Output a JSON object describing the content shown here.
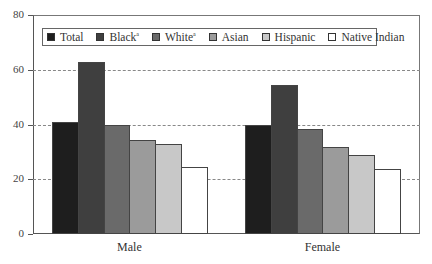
{
  "chart_data": {
    "type": "bar",
    "title": "",
    "xlabel": "",
    "ylabel": "",
    "ylim": [
      0,
      80
    ],
    "yticks": [
      0,
      20,
      40,
      60,
      80
    ],
    "grid": "dashed horizontal at 20, 40, 60",
    "legend_position": "top inside",
    "categories": [
      "Male",
      "Female"
    ],
    "series": [
      {
        "name": "Total",
        "sup": "",
        "color": "#1e1e1e",
        "values": [
          41,
          39.7
        ]
      },
      {
        "name": "Black",
        "sup": "a",
        "color": "#3f3f3f",
        "values": [
          63,
          54.4
        ]
      },
      {
        "name": "White",
        "sup": "a",
        "color": "#6a6a6a",
        "values": [
          39.7,
          38.4
        ]
      },
      {
        "name": "Asian",
        "sup": "",
        "color": "#9b9b9b",
        "values": [
          34.2,
          31.9
        ]
      },
      {
        "name": "Hispanic",
        "sup": "",
        "color": "#c8c8c8",
        "values": [
          33,
          28.7
        ]
      },
      {
        "name": "Native Indian",
        "sup": "",
        "color": "#ffffff",
        "values": [
          24.3,
          23.7
        ]
      }
    ]
  }
}
